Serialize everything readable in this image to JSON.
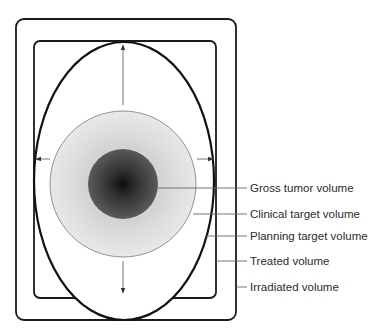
{
  "diagram": {
    "labels": [
      {
        "id": "gtv",
        "text": "Gross tumor volume",
        "y": 188
      },
      {
        "id": "ctv",
        "text": "Clinical target volume",
        "y": 214
      },
      {
        "id": "ptv",
        "text": "Planning target volume",
        "y": 236
      },
      {
        "id": "treated",
        "text": "Treated volume",
        "y": 261
      },
      {
        "id": "irradiated",
        "text": "Irradiated volume",
        "y": 287
      }
    ],
    "shapes": {
      "irradiated_rect": {
        "x": 16,
        "y": 19,
        "w": 220,
        "h": 301,
        "r": 8
      },
      "treated_rect": {
        "x": 34,
        "y": 41,
        "w": 182,
        "h": 257,
        "r": 6
      },
      "ptv_ellipse": {
        "cx": 124,
        "cy": 181,
        "rx": 90,
        "ry": 139
      },
      "ctv_circle": {
        "cx": 123,
        "cy": 184,
        "r": 73
      },
      "gtv_circle": {
        "cx": 123,
        "cy": 184,
        "r": 35
      }
    },
    "colors": {
      "outline": "#1a1a1a",
      "leader": "#666666",
      "ctv_fill": "#e4e4e4",
      "ctv_mid": "#d2d2d2",
      "gtv_edge": "#555555",
      "gtv_center": "#111111"
    }
  }
}
